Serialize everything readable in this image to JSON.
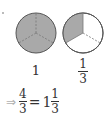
{
  "figure": {
    "circles": [
      {
        "label": "1",
        "parts": 3,
        "shaded": 3
      },
      {
        "label_numerator": "1",
        "label_denominator": "3",
        "parts": 3,
        "shaded": 1
      }
    ],
    "colors": {
      "shade": "#a9a9a9",
      "outline": "#555555",
      "divider": "#777777"
    }
  },
  "equation": {
    "arrow": "⇒",
    "lhs_numerator": "4",
    "lhs_denominator": "3",
    "equals": "=",
    "whole": "1",
    "rhs_numerator": "1",
    "rhs_denominator": "3"
  }
}
